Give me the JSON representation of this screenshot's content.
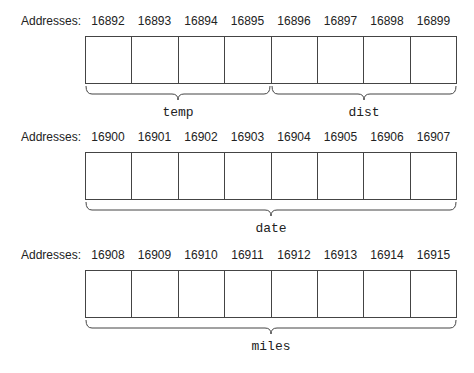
{
  "address_label": "Addresses:",
  "rows": [
    {
      "addresses": [
        "16892",
        "16893",
        "16894",
        "16895",
        "16896",
        "16897",
        "16898",
        "16899"
      ],
      "variables": [
        {
          "name": "temp",
          "start": 0,
          "end": 4
        },
        {
          "name": "dist",
          "start": 4,
          "end": 8
        }
      ]
    },
    {
      "addresses": [
        "16900",
        "16901",
        "16902",
        "16903",
        "16904",
        "16905",
        "16906",
        "16907"
      ],
      "variables": [
        {
          "name": "date",
          "start": 0,
          "end": 8
        }
      ]
    },
    {
      "addresses": [
        "16908",
        "16909",
        "16910",
        "16911",
        "16912",
        "16913",
        "16914",
        "16915"
      ],
      "variables": [
        {
          "name": "miles",
          "start": 0,
          "end": 8
        }
      ]
    }
  ]
}
